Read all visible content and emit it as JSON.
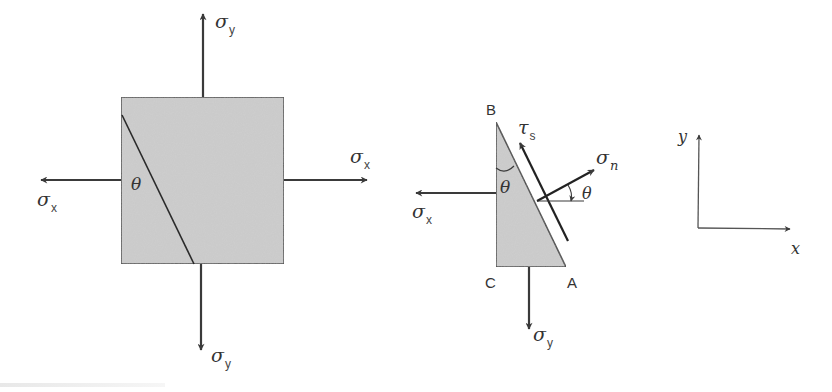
{
  "figure": {
    "colors": {
      "fill": "#c9c9c9",
      "stroke": "#3a3a3a",
      "text": "#333333",
      "background": "#ffffff"
    },
    "stress_element": {
      "angle_label": "θ",
      "arrows": {
        "top": {
          "symbol": "σ",
          "subscript": "y"
        },
        "bottom": {
          "symbol": "σ",
          "subscript": "y"
        },
        "left": {
          "symbol": "σ",
          "subscript": "x"
        },
        "right": {
          "symbol": "σ",
          "subscript": "x"
        }
      }
    },
    "free_body": {
      "vertices": {
        "B": "B",
        "C": "C",
        "A": "A"
      },
      "angle_at_B": "θ",
      "angle_normal": "θ",
      "arrows": {
        "left": {
          "symbol": "σ",
          "subscript": "x"
        },
        "bottom": {
          "symbol": "σ",
          "subscript": "y"
        },
        "shear": {
          "symbol": "τ",
          "subscript": "s"
        },
        "normal": {
          "symbol": "σ",
          "subscript": "n"
        }
      }
    },
    "axes": {
      "x_label": "x",
      "y_label": "y"
    }
  }
}
